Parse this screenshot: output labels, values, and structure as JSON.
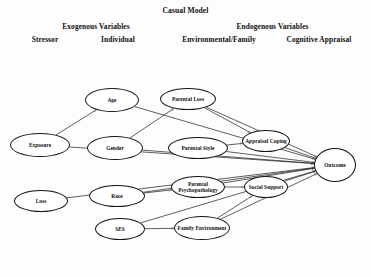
{
  "title": "Casual Model",
  "headings": {
    "exogenous": "Exogenous Variables",
    "endogenous": "Endogenous Variables",
    "stressor": "Stressor",
    "individual": "Individual",
    "environmental_family": "Environmental/Family",
    "cognitive_appraisal": "Cognitive Appraisal"
  },
  "diagram": {
    "type": "path-diagram",
    "shape_style": "ellipse",
    "line_color": "#1a1a1a",
    "background": "#fdfdfd",
    "nodes": [
      {
        "id": "exposure",
        "label": "Exposure",
        "column": "Stressor",
        "cx": 40,
        "cy": 145,
        "rx": 30,
        "ry": 12
      },
      {
        "id": "loss",
        "label": "Loss",
        "column": "Stressor",
        "cx": 41,
        "cy": 201,
        "rx": 27,
        "ry": 11
      },
      {
        "id": "age",
        "label": "Age",
        "column": "Individual",
        "cx": 112,
        "cy": 100,
        "rx": 27,
        "ry": 12
      },
      {
        "id": "gender",
        "label": "Gender",
        "column": "Individual",
        "cx": 115,
        "cy": 148,
        "rx": 28,
        "ry": 12
      },
      {
        "id": "race",
        "label": "Race",
        "column": "Individual",
        "cx": 117,
        "cy": 196,
        "rx": 28,
        "ry": 11
      },
      {
        "id": "ses",
        "label": "SES",
        "column": "Individual",
        "cx": 120,
        "cy": 229,
        "rx": 25,
        "ry": 11
      },
      {
        "id": "parental_loss",
        "label": "Parental Loss",
        "column": "Environmental/Family",
        "cx": 188,
        "cy": 99,
        "rx": 28,
        "ry": 11
      },
      {
        "id": "parental_style",
        "label": "Parental Style",
        "column": "Environmental/Family",
        "cx": 198,
        "cy": 148,
        "rx": 30,
        "ry": 11
      },
      {
        "id": "parental_psychopathology",
        "label": "Parental Psychopathology",
        "column": "Environmental/Family",
        "cx": 198,
        "cy": 187,
        "rx": 27,
        "ry": 11
      },
      {
        "id": "family_environment",
        "label": "Family Environment",
        "column": "Environmental/Family",
        "cx": 202,
        "cy": 228,
        "rx": 28,
        "ry": 12
      },
      {
        "id": "appraisal_coping",
        "label": "Appraisal Coping",
        "column": "Cognitive Appraisal",
        "cx": 266,
        "cy": 141,
        "rx": 24,
        "ry": 11
      },
      {
        "id": "social_support",
        "label": "Social Support",
        "column": "Cognitive Appraisal",
        "cx": 266,
        "cy": 187,
        "rx": 22,
        "ry": 11
      },
      {
        "id": "outcome",
        "label": "Outcome",
        "column": "Outcome",
        "cx": 335,
        "cy": 165,
        "rx": 21,
        "ry": 17
      }
    ],
    "edges": [
      {
        "from": "exposure",
        "to": "outcome"
      },
      {
        "from": "loss",
        "to": "outcome"
      },
      {
        "from": "age",
        "to": "outcome"
      },
      {
        "from": "gender",
        "to": "outcome"
      },
      {
        "from": "race",
        "to": "outcome"
      },
      {
        "from": "ses",
        "to": "outcome"
      },
      {
        "from": "parental_loss",
        "to": "outcome"
      },
      {
        "from": "parental_style",
        "to": "outcome"
      },
      {
        "from": "parental_psychopathology",
        "to": "outcome"
      },
      {
        "from": "family_environment",
        "to": "outcome"
      },
      {
        "from": "appraisal_coping",
        "to": "outcome"
      },
      {
        "from": "social_support",
        "to": "outcome"
      },
      {
        "from": "exposure",
        "to": "age"
      },
      {
        "from": "gender",
        "to": "parental_loss"
      },
      {
        "from": "race",
        "to": "parental_psychopathology"
      },
      {
        "from": "ses",
        "to": "family_environment"
      },
      {
        "from": "parental_loss",
        "to": "appraisal_coping"
      },
      {
        "from": "parental_style",
        "to": "appraisal_coping"
      },
      {
        "from": "parental_psychopathology",
        "to": "social_support"
      },
      {
        "from": "family_environment",
        "to": "social_support"
      }
    ]
  }
}
